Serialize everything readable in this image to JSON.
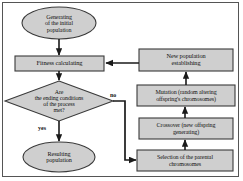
{
  "diagram": {
    "colors": {
      "node_fill": "#cfcfcf",
      "node_stroke": "#3a3a3a",
      "edge_stroke": "#1a1a1a",
      "frame_stroke": "#555555",
      "text": "#111111",
      "background": "#ffffff"
    },
    "nodes": [
      {
        "id": "start",
        "shape": "ellipse",
        "label": "Generating\nof the initial\npopulation"
      },
      {
        "id": "fitness",
        "shape": "rectangle",
        "label": "Fitness calculating"
      },
      {
        "id": "decision",
        "shape": "diamond",
        "label": "Are\nthe ending conditions\nof the process\nmet?"
      },
      {
        "id": "result",
        "shape": "ellipse",
        "label": "Resulting\npopulation"
      },
      {
        "id": "newpop",
        "shape": "rectangle",
        "label": "New population\nestablishing"
      },
      {
        "id": "mutation",
        "shape": "rectangle",
        "label": "Mutation (random altering\noffspring's chromosomes)"
      },
      {
        "id": "crossover",
        "shape": "rectangle",
        "label": "Crossover (new offspring\ngenerating)"
      },
      {
        "id": "selection",
        "shape": "rectangle",
        "label": "Selection of the parental\nchromosomes"
      }
    ],
    "edges": [
      {
        "from": "start",
        "to": "fitness",
        "label": ""
      },
      {
        "from": "fitness",
        "to": "decision",
        "label": ""
      },
      {
        "from": "decision",
        "to": "result",
        "label": "yes"
      },
      {
        "from": "decision",
        "to": "selection",
        "label": "no"
      },
      {
        "from": "selection",
        "to": "crossover",
        "label": ""
      },
      {
        "from": "crossover",
        "to": "mutation",
        "label": ""
      },
      {
        "from": "mutation",
        "to": "newpop",
        "label": ""
      },
      {
        "from": "newpop",
        "to": "fitness",
        "label": ""
      }
    ],
    "labels": {
      "start_line1": "Generating",
      "start_line2": "of the initial",
      "start_line3": "population",
      "fitness_line1": "Fitness calculating",
      "decision_line1": "Are",
      "decision_line2": "the ending conditions",
      "decision_line3": "of the process",
      "decision_line4": "met?",
      "result_line1": "Resulting",
      "result_line2": "population",
      "newpop_line1": "New population",
      "newpop_line2": "establishing",
      "mutation_line1": "Mutation (random altering",
      "mutation_line2": "offspring's chromosomes)",
      "crossover_line1": "Crossover (new offspring",
      "crossover_line2": "generating)",
      "selection_line1": "Selection of the parental",
      "selection_line2": "chromosomes",
      "edge_yes": "yes",
      "edge_no": "no"
    }
  }
}
